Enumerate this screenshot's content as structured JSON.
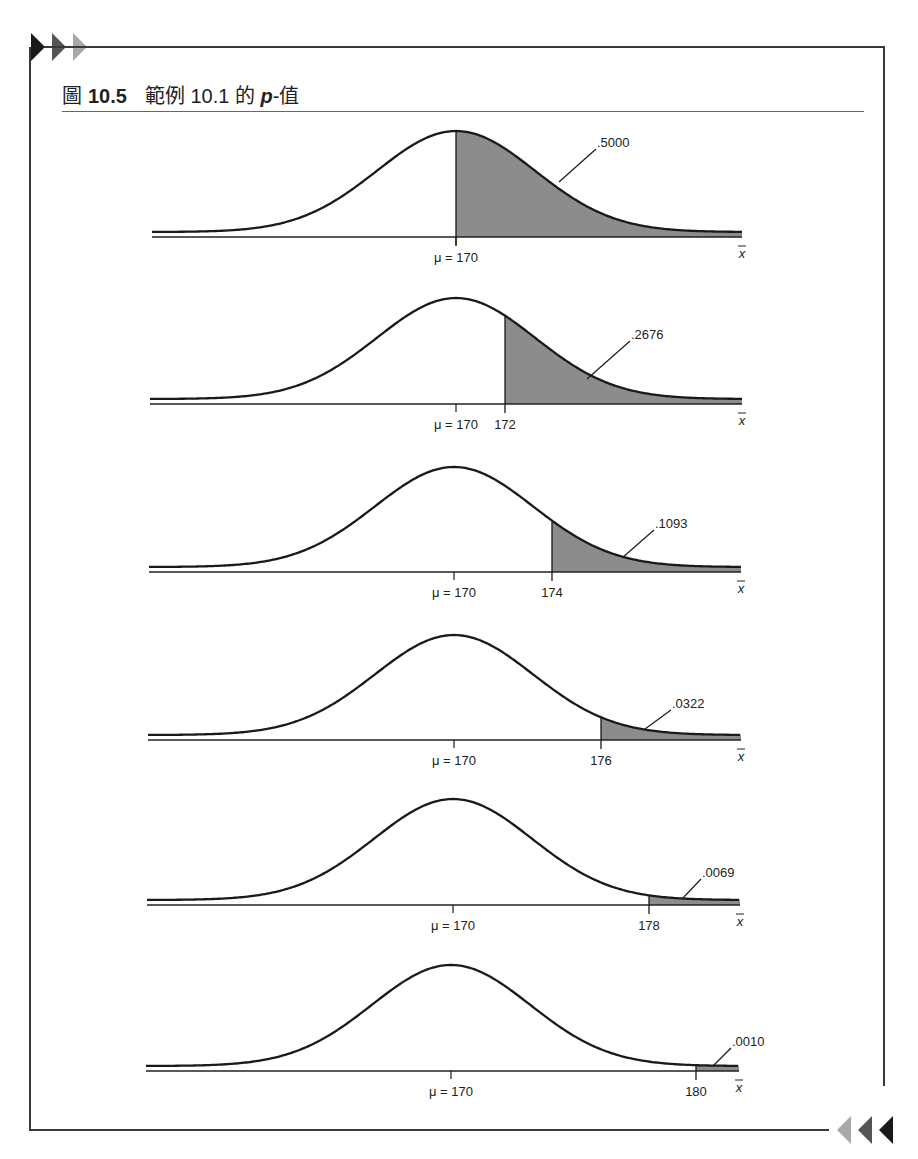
{
  "figure": {
    "label": "圖",
    "number": "10.5",
    "caption_prefix": "範例 10.1 的",
    "caption_var": "p",
    "caption_suffix": "-值"
  },
  "decor": {
    "arrow_colors_top": [
      "#1a1a1a",
      "#555555",
      "#a8a8a8"
    ],
    "arrow_colors_bottom": [
      "#a8a8a8",
      "#555555",
      "#1a1a1a"
    ],
    "shade_color": "#8c8c8c"
  },
  "chart_data": {
    "type": "area",
    "xlabel": "x̄",
    "mean_label": "μ = 170",
    "mean": 170,
    "sigma_xbar": 3.226,
    "panels": [
      {
        "cutoff": 170,
        "cutoff_label": "",
        "p_value": ".5000"
      },
      {
        "cutoff": 172,
        "cutoff_label": "172",
        "p_value": ".2676"
      },
      {
        "cutoff": 174,
        "cutoff_label": "174",
        "p_value": ".1093"
      },
      {
        "cutoff": 176,
        "cutoff_label": "176",
        "p_value": ".0322"
      },
      {
        "cutoff": 178,
        "cutoff_label": "178",
        "p_value": ".0069"
      },
      {
        "cutoff": 180,
        "cutoff_label": "180",
        "p_value": ".0010"
      }
    ]
  }
}
